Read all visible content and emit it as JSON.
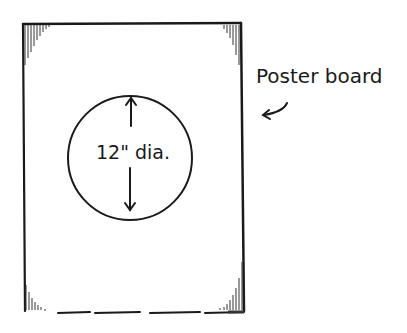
{
  "diagram": {
    "board_label": "Poster board",
    "circle_label": "12\" dia.",
    "colors": {
      "ink": "#1a1a1a",
      "background": "#ffffff"
    }
  }
}
